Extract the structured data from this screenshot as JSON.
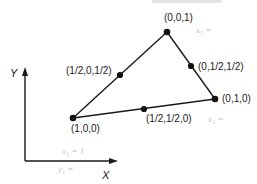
{
  "diagram": {
    "type": "ternary-triangle",
    "colors": {
      "line": "#1a1a1a",
      "point": "#111111",
      "annotation": "#c4c4c4",
      "background": "#ffffff"
    },
    "axes": {
      "x_label": "X",
      "y_label": "Y"
    },
    "vertices": [
      {
        "id": "v100",
        "label": "(1,0,0)",
        "x": 73,
        "y": 118
      },
      {
        "id": "v010",
        "label": "(0,1,0)",
        "x": 215,
        "y": 99
      },
      {
        "id": "v001",
        "label": "(0,0,1)",
        "x": 167,
        "y": 32
      }
    ],
    "midpoints": [
      {
        "id": "m_half0half",
        "label": "(1/2,0,1/2)",
        "x": 120,
        "y": 75
      },
      {
        "id": "m_0halfhalf",
        "label": "(0,1/2,1/2)",
        "x": 191,
        "y": 66
      },
      {
        "id": "m_halfhalf0",
        "label": "(1/2,1/2,0)",
        "x": 144,
        "y": 109
      }
    ],
    "annotations": [
      {
        "id": "note_x3",
        "text": "x₃ ="
      },
      {
        "id": "note_x2",
        "text": "x₂ ="
      },
      {
        "id": "note_x1",
        "text": "x₁ = 1"
      },
      {
        "id": "note_y1",
        "text": "y₁ ="
      }
    ]
  }
}
